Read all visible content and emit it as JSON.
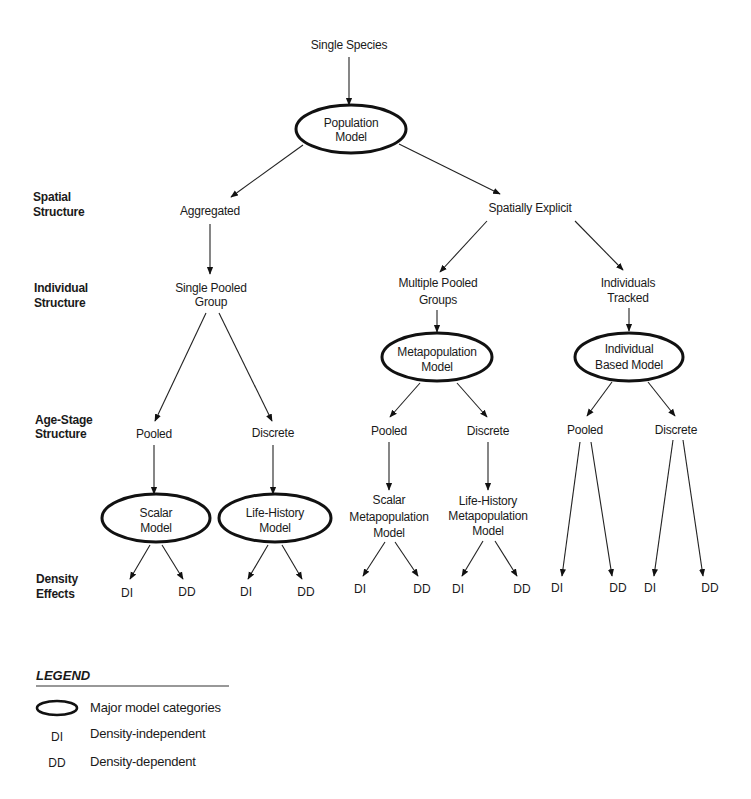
{
  "diagram": {
    "root": {
      "label": "Single Species"
    },
    "row_labels": {
      "spatial": [
        "Spatial",
        "Structure"
      ],
      "individual": [
        "Individual",
        "Structure"
      ],
      "age_stage": [
        "Age-Stage",
        "Structure"
      ],
      "density": [
        "Density",
        "Effects"
      ]
    },
    "nodes": {
      "population_model": [
        "Population",
        "Model"
      ],
      "aggregated": [
        "Aggregated"
      ],
      "spatially_explicit": [
        "Spatially Explicit"
      ],
      "single_pooled_group": [
        "Single Pooled",
        "Group"
      ],
      "multiple_pooled_groups": [
        "Multiple Pooled",
        "Groups"
      ],
      "individuals_tracked": [
        "Individuals",
        "Tracked"
      ],
      "metapopulation_model": [
        "Metapopulation",
        "Model"
      ],
      "individual_based_model": [
        "Individual",
        "Based Model"
      ],
      "agg_pooled": [
        "Pooled"
      ],
      "agg_discrete": [
        "Discrete"
      ],
      "meta_pooled": [
        "Pooled"
      ],
      "meta_discrete": [
        "Discrete"
      ],
      "ibm_pooled": [
        "Pooled"
      ],
      "ibm_discrete": [
        "Discrete"
      ],
      "scalar_model": [
        "Scalar",
        "Model"
      ],
      "life_history_model": [
        "Life-History",
        "Model"
      ],
      "scalar_metapopulation_model": [
        "Scalar",
        "Metapopulation",
        "Model"
      ],
      "life_history_metapopulation_model": [
        "Life-History",
        "Metapopulation",
        "Model"
      ]
    },
    "leaves": {
      "scalar": [
        "DI",
        "DD"
      ],
      "life_history": [
        "DI",
        "DD"
      ],
      "scalar_meta": [
        "DI",
        "DD"
      ],
      "life_history_meta": [
        "DI",
        "DD"
      ],
      "ibm_pooled": [
        "DI",
        "DD"
      ],
      "ibm_discrete": [
        "DI",
        "DD"
      ]
    },
    "major_categories": [
      "Population Model",
      "Metapopulation Model",
      "Individual Based Model",
      "Scalar Model",
      "Life-History Model"
    ],
    "edges": [
      [
        "Single Species",
        "Population Model"
      ],
      [
        "Population Model",
        "Aggregated"
      ],
      [
        "Population Model",
        "Spatially Explicit"
      ],
      [
        "Aggregated",
        "Single Pooled Group"
      ],
      [
        "Spatially Explicit",
        "Multiple Pooled Groups"
      ],
      [
        "Spatially Explicit",
        "Individuals Tracked"
      ],
      [
        "Multiple Pooled Groups",
        "Metapopulation Model"
      ],
      [
        "Individuals Tracked",
        "Individual Based Model"
      ],
      [
        "Single Pooled Group",
        "Pooled"
      ],
      [
        "Single Pooled Group",
        "Discrete"
      ],
      [
        "Metapopulation Model",
        "Pooled"
      ],
      [
        "Metapopulation Model",
        "Discrete"
      ],
      [
        "Individual Based Model",
        "Pooled"
      ],
      [
        "Individual Based Model",
        "Discrete"
      ],
      [
        "Pooled",
        "Scalar Model"
      ],
      [
        "Discrete",
        "Life-History Model"
      ],
      [
        "Pooled",
        "Scalar Metapopulation Model"
      ],
      [
        "Discrete",
        "Life-History Metapopulation Model"
      ]
    ]
  },
  "legend": {
    "title": "LEGEND",
    "items": [
      {
        "symbol": "ellipse",
        "label": "Major model categories"
      },
      {
        "symbol": "DI",
        "label": "Density-independent"
      },
      {
        "symbol": "DD",
        "label": "Density-dependent"
      }
    ]
  }
}
